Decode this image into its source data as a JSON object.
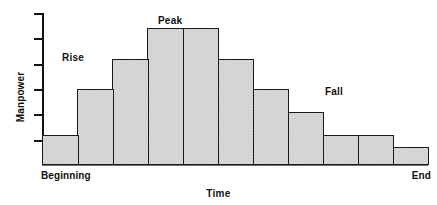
{
  "chart_data": {
    "type": "bar",
    "title": "",
    "xlabel": "Time",
    "ylabel": "Manpower",
    "grid": false,
    "legend": null,
    "xlim_labels": [
      "Beginning",
      "End"
    ],
    "ylim": [
      0,
      5
    ],
    "ytick_count": 5,
    "ytick_labels": [
      "",
      "",
      "",
      "",
      ""
    ],
    "categories": [
      "1",
      "2",
      "3",
      "4",
      "5",
      "6",
      "7",
      "8",
      "9",
      "10",
      "11"
    ],
    "values": [
      1,
      2.5,
      3.5,
      4.5,
      4.5,
      3.5,
      2.5,
      1.75,
      1,
      1,
      0.6
    ],
    "bar_fill_color": "#dcdcdc",
    "bar_edge_color": "#1a1a1a",
    "annotations": [
      {
        "text": "Rise",
        "x_px": 62,
        "y_px": 52
      },
      {
        "text": "Peak",
        "x_px": 158,
        "y_px": 15
      },
      {
        "text": "Fall",
        "x_px": 325,
        "y_px": 86
      }
    ]
  },
  "axis": {
    "y_title": "Manpower",
    "x_title": "Time",
    "x_start_caption": "Beginning",
    "x_end_caption": "End"
  }
}
